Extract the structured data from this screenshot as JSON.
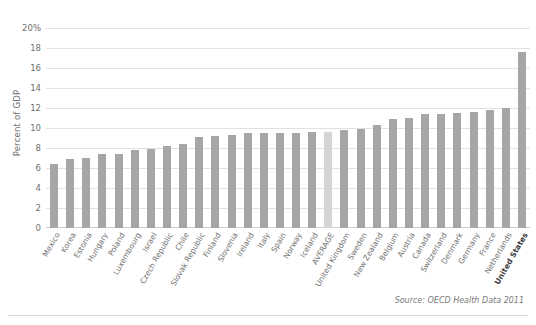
{
  "chart_data": {
    "type": "bar",
    "title": "",
    "xlabel": "",
    "ylabel": "Percent of GDP",
    "ylim": [
      0,
      20
    ],
    "ytick_labels": [
      "20%",
      "18",
      "16",
      "14",
      "12",
      "10",
      "8",
      "6",
      "4",
      "2",
      "0"
    ],
    "ytick_values": [
      20,
      18,
      16,
      14,
      12,
      10,
      8,
      6,
      4,
      2,
      0
    ],
    "grid": true,
    "legend": "none",
    "bar_color": "#a6a6a6",
    "highlight_color": "#d4d4d4",
    "highlight_category": "AVERAGE",
    "bold_category": "United States",
    "categories": [
      "Mexico",
      "Korea",
      "Estonia",
      "Hungary",
      "Poland",
      "Luxembourg",
      "Israel",
      "Czech Republic",
      "Chile",
      "Slovak Republic",
      "Finland",
      "Slovenia",
      "Ireland",
      "Italy",
      "Spain",
      "Norway",
      "Iceland",
      "AVERAGE",
      "United Kingdom",
      "Sweden",
      "New Zealand",
      "Belgium",
      "Austria",
      "Canada",
      "Switzerland",
      "Denmark",
      "Germany",
      "France",
      "Netherlands",
      "United States"
    ],
    "values": [
      6.4,
      6.9,
      7.0,
      7.4,
      7.4,
      7.8,
      7.9,
      8.2,
      8.4,
      9.1,
      9.2,
      9.3,
      9.5,
      9.5,
      9.5,
      9.5,
      9.6,
      9.6,
      9.8,
      9.9,
      10.3,
      10.9,
      11.0,
      11.4,
      11.4,
      11.5,
      11.6,
      11.8,
      12.0,
      17.6
    ],
    "source": "Source: OECD Health Data 2011"
  },
  "figure": {
    "page_marker": ""
  }
}
